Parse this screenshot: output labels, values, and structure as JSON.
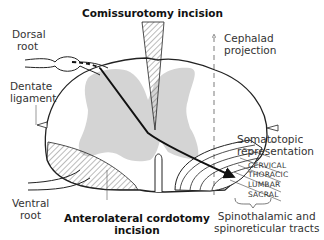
{
  "labels": {
    "commissurotomy": "Comissurotomy incision",
    "dorsal_root": [
      "Dorsal",
      "root"
    ],
    "dentate_ligament": [
      "Dentate",
      "ligament"
    ],
    "ventral_root": [
      "Ventral",
      "root"
    ],
    "anterolateral": [
      "Anterolateral cordotomy",
      "incision"
    ],
    "cephalad": [
      "Cephalad",
      "projection"
    ],
    "somatotopic": [
      "Somatotopic",
      "representation"
    ],
    "levels": [
      "CERVICAL",
      "THORACIC",
      "LUMBAR",
      "SACRAL"
    ],
    "tracts": [
      "Spinothalamic and",
      "spinoreticular tracts"
    ]
  },
  "colors": {
    "grey_matter": "#d4d4d4",
    "outline": "#222222",
    "hatch": "#555555"
  }
}
